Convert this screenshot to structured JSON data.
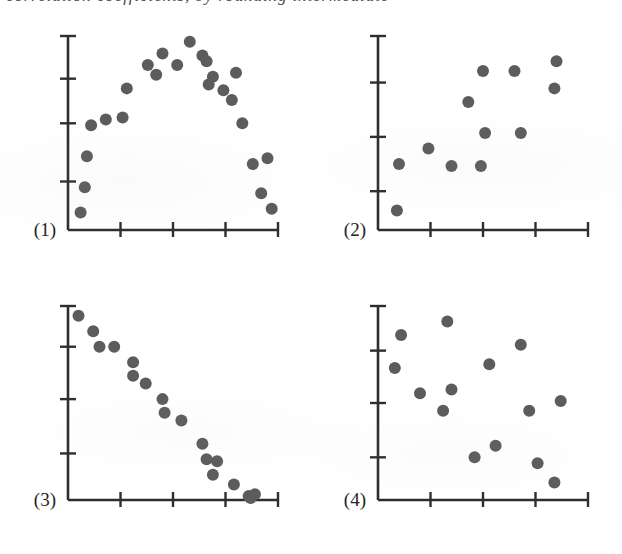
{
  "figure": {
    "title_fragment_top": "correlation coefficients, by rounding intermediate",
    "background_color": "#ffffff",
    "dot_color": "#5c5c5c",
    "axis_color": "#2e2e2e",
    "panel_count": 4
  },
  "panels": [
    {
      "label": "(1)",
      "name": "panel-1",
      "description": "curvilinear inverted-U scatter",
      "axis": {
        "x_ticks": 4,
        "y_ticks": 4,
        "grid": false,
        "x_tick_positions": [
          0.25,
          0.5,
          0.75,
          1.0
        ],
        "y_tick_positions": [
          0.25,
          0.55,
          0.78,
          1.0
        ]
      }
    },
    {
      "label": "(2)",
      "name": "panel-2",
      "description": "weak positive scatter",
      "axis": {
        "x_ticks": 4,
        "y_ticks": 4,
        "grid": false,
        "x_tick_positions": [
          0.25,
          0.5,
          0.75,
          1.0
        ],
        "y_tick_positions": [
          0.2,
          0.48,
          0.76,
          1.0
        ]
      }
    },
    {
      "label": "(3)",
      "name": "panel-3",
      "description": "strong negative linear scatter",
      "axis": {
        "x_ticks": 4,
        "y_ticks": 4,
        "grid": false,
        "x_tick_positions": [
          0.25,
          0.5,
          0.75,
          1.0
        ],
        "y_tick_positions": [
          0.24,
          0.52,
          0.79,
          1.0
        ]
      }
    },
    {
      "label": "(4)",
      "name": "panel-4",
      "description": "no correlation random scatter",
      "axis": {
        "x_ticks": 4,
        "y_ticks": 4,
        "grid": false,
        "x_tick_positions": [
          0.25,
          0.5,
          0.75,
          1.0
        ],
        "y_tick_positions": [
          0.22,
          0.5,
          0.77,
          1.0
        ]
      }
    }
  ],
  "chart_data": [
    {
      "type": "scatter",
      "panel": "(1)",
      "title": "",
      "xlabel": "",
      "ylabel": "",
      "xlim": [
        0,
        100
      ],
      "ylim": [
        0,
        100
      ],
      "grid": false,
      "legend": "none",
      "relationship": "curvilinear (inverted U), r near zero",
      "points": [
        [
          6,
          9
        ],
        [
          8,
          22
        ],
        [
          9,
          38
        ],
        [
          11,
          54
        ],
        [
          18,
          57
        ],
        [
          26,
          58
        ],
        [
          28,
          73
        ],
        [
          38,
          85
        ],
        [
          42,
          80
        ],
        [
          45,
          91
        ],
        [
          52,
          85
        ],
        [
          58,
          97
        ],
        [
          64,
          90
        ],
        [
          66,
          87
        ],
        [
          69,
          79
        ],
        [
          67,
          75
        ],
        [
          74,
          72
        ],
        [
          78,
          67
        ],
        [
          80,
          81
        ],
        [
          83,
          55
        ],
        [
          88,
          34
        ],
        [
          95,
          37
        ],
        [
          92,
          19
        ],
        [
          97,
          11
        ]
      ]
    },
    {
      "type": "scatter",
      "panel": "(2)",
      "title": "",
      "xlabel": "",
      "ylabel": "",
      "xlim": [
        0,
        100
      ],
      "ylim": [
        0,
        100
      ],
      "grid": false,
      "legend": "none",
      "relationship": "weak positive linear, r approximately 0.6",
      "points": [
        [
          9,
          10
        ],
        [
          10,
          34
        ],
        [
          24,
          42
        ],
        [
          35,
          33
        ],
        [
          43,
          66
        ],
        [
          51,
          50
        ],
        [
          50,
          82
        ],
        [
          49,
          33
        ],
        [
          65,
          82
        ],
        [
          68,
          50
        ],
        [
          85,
          87
        ],
        [
          84,
          73
        ]
      ]
    },
    {
      "type": "scatter",
      "panel": "(3)",
      "title": "",
      "xlabel": "",
      "ylabel": "",
      "xlim": [
        0,
        100
      ],
      "ylim": [
        0,
        100
      ],
      "grid": false,
      "legend": "none",
      "relationship": "strong negative linear, r approximately -0.98",
      "points": [
        [
          5,
          95
        ],
        [
          12,
          87
        ],
        [
          15,
          79
        ],
        [
          22,
          79
        ],
        [
          31,
          71
        ],
        [
          31,
          64
        ],
        [
          37,
          60
        ],
        [
          45,
          52
        ],
        [
          46,
          45
        ],
        [
          54,
          41
        ],
        [
          64,
          29
        ],
        [
          66,
          21
        ],
        [
          71,
          20
        ],
        [
          69,
          13
        ],
        [
          79,
          8
        ],
        [
          86,
          2
        ],
        [
          89,
          3
        ],
        [
          87,
          1
        ]
      ]
    },
    {
      "type": "scatter",
      "panel": "(4)",
      "title": "",
      "xlabel": "",
      "ylabel": "",
      "xlim": [
        0,
        100
      ],
      "ylim": [
        0,
        100
      ],
      "grid": false,
      "legend": "none",
      "relationship": "no correlation, r near zero",
      "points": [
        [
          11,
          85
        ],
        [
          8,
          68
        ],
        [
          20,
          55
        ],
        [
          33,
          92
        ],
        [
          35,
          57
        ],
        [
          31,
          46
        ],
        [
          46,
          22
        ],
        [
          53,
          70
        ],
        [
          56,
          28
        ],
        [
          68,
          80
        ],
        [
          72,
          46
        ],
        [
          76,
          19
        ],
        [
          87,
          51
        ],
        [
          84,
          9
        ]
      ]
    }
  ]
}
